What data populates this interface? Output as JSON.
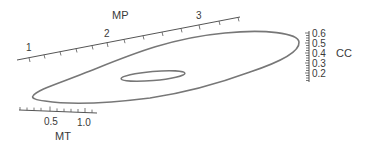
{
  "diagram": {
    "type": "3d-projected-loop",
    "colors": {
      "axis": "#555555",
      "curve": "#777777",
      "text": "#3a3a3a",
      "background": "#ffffff"
    },
    "axes": {
      "mp": {
        "title": "MP",
        "ticks": [
          "1",
          "2",
          "3"
        ]
      },
      "cc": {
        "title": "CC",
        "ticks": [
          "0.6",
          "0.5",
          "0.4",
          "0.3",
          "0.2"
        ]
      },
      "mt": {
        "title": "MT",
        "ticks": [
          "0.5",
          "1.0"
        ]
      }
    },
    "curves": [
      {
        "name": "outer-loop"
      },
      {
        "name": "inner-loop"
      }
    ]
  }
}
